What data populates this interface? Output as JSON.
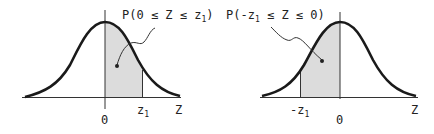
{
  "left": {
    "title": "P(0 ≤ Z ≤ z",
    "title_sub": "1",
    "title_end": ")",
    "zero": "0",
    "z1": "z",
    "z1_sub": "1",
    "axis": "Z"
  },
  "right": {
    "title": "P(-z",
    "title_sub": "1",
    "title_end": " ≤ Z ≤ 0)",
    "zero": "0",
    "z1": "-z",
    "z1_sub": "1",
    "axis": "Z"
  },
  "colors": {
    "curve": "#1a1a1a",
    "shade": "#d9d9d9"
  }
}
